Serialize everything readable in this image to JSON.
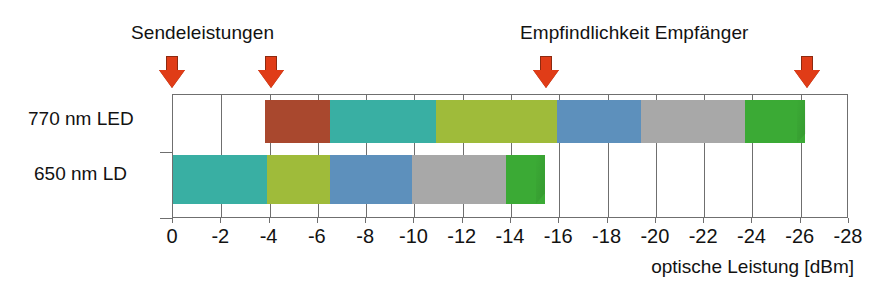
{
  "annotations": {
    "transmit_label": "Sendeleistungen",
    "receive_label": "Empfindlichkeit Empfänger",
    "arrow_icon": "arrow-down-icon",
    "arrow_color": "#E03C17",
    "markers": [
      {
        "name": "transmit-led",
        "dbm": 0
      },
      {
        "name": "transmit-ld",
        "dbm": -4.1
      },
      {
        "name": "sensitivity-ld",
        "dbm": -15.5
      },
      {
        "name": "sensitivity-led",
        "dbm": -26.3
      }
    ]
  },
  "rows": {
    "led_label": "770 nm LED",
    "ld_label": "650 nm LD"
  },
  "axis": {
    "title": "optische Leistung [dBm]",
    "ticks": [
      "0",
      "-2",
      "-4",
      "-6",
      "-8",
      "-10",
      "-12",
      "-14",
      "-16",
      "-18",
      "-20",
      "-22",
      "-24",
      "-26",
      "-28"
    ],
    "min": 0,
    "max": -28
  },
  "chart_data": {
    "type": "bar",
    "title": "",
    "xlabel": "optische Leistung [dBm]",
    "ylabel": "",
    "xlim": [
      0,
      -28
    ],
    "grid": true,
    "orientation": "horizontal",
    "categories": [
      "770 nm LED",
      "650 nm LD"
    ],
    "tick_labels": [
      "0",
      "-2",
      "-4",
      "-6",
      "-8",
      "-10",
      "-12",
      "-14",
      "-16",
      "-18",
      "-20",
      "-22",
      "-24",
      "-26",
      "-28"
    ],
    "series": [
      {
        "name": "770 nm LED",
        "start_dbm": -3.8,
        "end_dbm": -26.2,
        "segments": [
          {
            "name": "segment-red",
            "from": -3.8,
            "to": -6.5,
            "color": "#A9482E"
          },
          {
            "name": "segment-teal",
            "from": -6.5,
            "to": -10.9,
            "color": "#39AFA3"
          },
          {
            "name": "segment-olive",
            "from": -10.9,
            "to": -15.9,
            "color": "#9FBB3A"
          },
          {
            "name": "segment-blue",
            "from": -15.9,
            "to": -19.4,
            "color": "#5D90BC"
          },
          {
            "name": "segment-gray",
            "from": -19.4,
            "to": -23.7,
            "color": "#A8A8A8"
          },
          {
            "name": "segment-green",
            "from": -23.7,
            "to": -26.2,
            "color": "#3BAA35"
          }
        ]
      },
      {
        "name": "650 nm LD",
        "start_dbm": 0,
        "end_dbm": -15.4,
        "segments": [
          {
            "name": "segment-teal",
            "from": 0,
            "to": -3.9,
            "color": "#39AFA3"
          },
          {
            "name": "segment-olive",
            "from": -3.9,
            "to": -6.5,
            "color": "#9FBB3A"
          },
          {
            "name": "segment-blue",
            "from": -6.5,
            "to": -9.9,
            "color": "#5D90BC"
          },
          {
            "name": "segment-gray",
            "from": -9.9,
            "to": -13.8,
            "color": "#A8A8A8"
          },
          {
            "name": "segment-green",
            "from": -13.8,
            "to": -15.4,
            "color": "#3BAA35"
          }
        ]
      }
    ],
    "annotations": [
      {
        "text": "Sendeleistungen",
        "points_to_dbm": [
          0,
          -4.1
        ]
      },
      {
        "text": "Empfindlichkeit Empfänger",
        "points_to_dbm": [
          -15.5,
          -26.3
        ]
      }
    ]
  }
}
